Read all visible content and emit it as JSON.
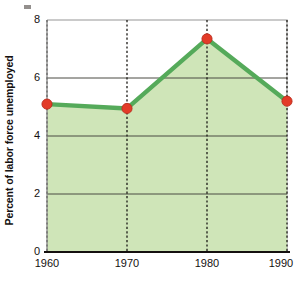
{
  "chart_data": {
    "type": "area",
    "title": "",
    "subtitle": "",
    "xlabel": "",
    "ylabel": "Percent of labor force unemployed",
    "categories": [
      "1960",
      "1970",
      "1980",
      "1990"
    ],
    "x": [
      1960,
      1970,
      1980,
      1990
    ],
    "values": [
      5.1,
      4.95,
      7.35,
      5.2
    ],
    "series": [
      {
        "name": "Percent of labor force unemployed",
        "values": [
          5.1,
          4.95,
          7.35,
          5.2
        ]
      }
    ],
    "xlim": [
      1960,
      1990
    ],
    "ylim": [
      0,
      8
    ],
    "yticks": [
      0,
      2,
      4,
      6,
      8
    ],
    "ytick_labels": [
      "0",
      "2",
      "4",
      "6",
      "8"
    ],
    "xticks": [
      1960,
      1970,
      1980,
      1990
    ],
    "xtick_labels": [
      "1960",
      "1970",
      "1980",
      "1990"
    ],
    "grid": {
      "horizontal": true,
      "vertical": true,
      "vertical_style": "dotted",
      "horizontal_style": "solid"
    },
    "legend": {
      "visible": false,
      "position": "none",
      "entries": []
    },
    "annotations": [],
    "markers": {
      "shape": "circle",
      "color": "#e33b28"
    },
    "colors": {
      "area_fill": "#cfe5b8",
      "line": "#55aa5a",
      "marker": "#e33b28",
      "marker_edge": "#b52a1c",
      "gridline": "#4a4a42",
      "axis": "#14100f",
      "frame": "#b9b9b9",
      "text": "#14100f",
      "background": "#ffffff"
    }
  },
  "axes": {
    "y_title": "Percent of labor force unemployed",
    "y_labels": [
      "8",
      "6",
      "4",
      "2",
      "0"
    ],
    "x_labels": [
      "1960",
      "1970",
      "1980",
      "1990"
    ]
  }
}
